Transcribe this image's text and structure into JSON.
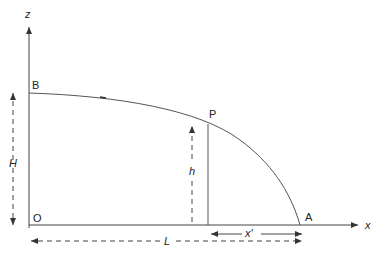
{
  "diagram": {
    "axes": {
      "x_label": "x",
      "z_label": "z",
      "origin_label": "O"
    },
    "points": {
      "A": "A",
      "B": "B",
      "P": "P"
    },
    "dimensions": {
      "H": "H",
      "h": "h",
      "L": "L",
      "x_prime": "x'"
    },
    "colors": {
      "stroke": "#333333",
      "background": "#ffffff"
    }
  }
}
